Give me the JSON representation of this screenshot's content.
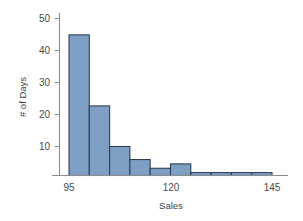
{
  "chart_data": {
    "type": "bar",
    "title": "",
    "subtitle": "",
    "xlabel": "Sales",
    "ylabel": "# of Days",
    "bin_width": 5,
    "bin_starts": [
      95,
      100,
      105,
      110,
      115,
      120,
      125,
      130,
      135,
      140
    ],
    "categories": [
      "95-100",
      "100-105",
      "105-110",
      "110-115",
      "115-120",
      "120-125",
      "125-130",
      "130-135",
      "135-140",
      "140-145"
    ],
    "values": [
      48.5,
      24,
      10,
      5.5,
      2.5,
      4,
      1,
      1,
      1,
      1
    ],
    "xlim": [
      93,
      147
    ],
    "ylim": [
      0,
      52
    ],
    "x_ticks": [
      95,
      120,
      145
    ],
    "x_tick_labels": [
      "95",
      "120",
      "145"
    ],
    "y_ticks": [
      10,
      20,
      30,
      40,
      50
    ],
    "y_tick_labels": [
      "10",
      "20",
      "30",
      "40",
      "50"
    ],
    "grid": false,
    "legend": false,
    "bar_fill_color": "#7d9fc4",
    "bar_edge_color": "#2b3a52",
    "axis_color": "#8d8d8d",
    "background_color": "#ffffff"
  },
  "labels": {
    "y_axis_title": "# of Days",
    "x_axis_title": "Sales",
    "y_tick_50": "50",
    "y_tick_40": "40",
    "y_tick_30": "30",
    "y_tick_20": "20",
    "y_tick_10": "10",
    "x_tick_95": "95",
    "x_tick_120": "120",
    "x_tick_145": "145"
  }
}
